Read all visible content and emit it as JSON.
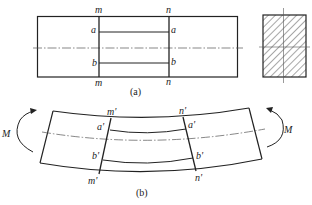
{
  "figure": {
    "panel_a": {
      "caption": "(a)",
      "labels": {
        "m_top": "m",
        "n_top": "n",
        "a_left": "a",
        "a_right": "a",
        "b_left": "b",
        "b_right": "b",
        "m_bottom": "m",
        "n_bottom": "n"
      },
      "cross_section": {
        "fill_pattern": "hatched"
      }
    },
    "panel_b": {
      "caption": "(b)",
      "labels": {
        "m_top": "m'",
        "n_top": "n'",
        "a_left": "a'",
        "a_right": "a'",
        "b_left": "b'",
        "b_right": "b'",
        "m_bottom": "m'",
        "n_bottom": "n'",
        "moment_left": "M",
        "moment_right": "M"
      }
    },
    "colors": {
      "line": "#222222",
      "centerline": "#555555",
      "background": "#ffffff"
    }
  }
}
